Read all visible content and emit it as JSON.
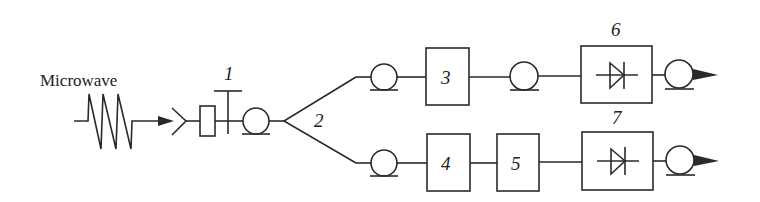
{
  "diagram": {
    "type": "block-diagram",
    "input_label": "Microwave",
    "components": [
      {
        "id": "1",
        "label": "1",
        "description": "stub tuner / junction"
      },
      {
        "id": "2",
        "label": "2",
        "description": "power splitter"
      },
      {
        "id": "3",
        "label": "3",
        "description": "block"
      },
      {
        "id": "4",
        "label": "4",
        "description": "block"
      },
      {
        "id": "5",
        "label": "5",
        "description": "block"
      },
      {
        "id": "6",
        "label": "6",
        "description": "detector (diode)"
      },
      {
        "id": "7",
        "label": "7",
        "description": "detector (diode)"
      }
    ],
    "branches": [
      {
        "name": "upper",
        "path": [
          "cable",
          "3",
          "cable",
          "6",
          "cable",
          "output"
        ]
      },
      {
        "name": "lower",
        "path": [
          "cable",
          "4",
          "5",
          "7",
          "cable",
          "output"
        ]
      }
    ],
    "colors": {
      "stroke": "#2a2a2a",
      "background": "#ffffff"
    }
  }
}
